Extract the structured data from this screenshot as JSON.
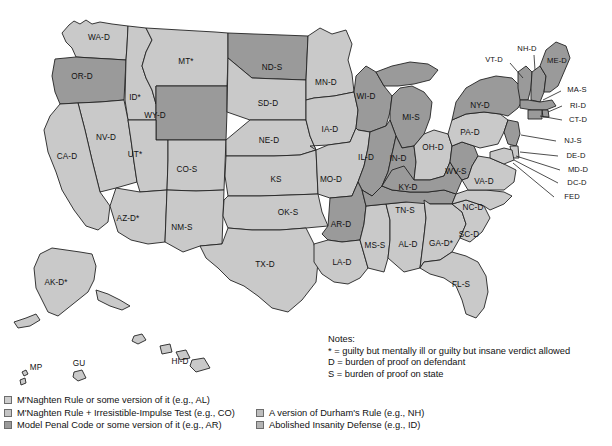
{
  "map": {
    "title_present": false,
    "colors": {
      "shade_light": "#c9c9c9",
      "shade_dark": "#9a9a9a",
      "border": "#222222",
      "background": "#ffffff",
      "label": "#111111"
    },
    "states": [
      {
        "code": "WA-D",
        "x": 99,
        "y": 38,
        "shade": "light"
      },
      {
        "code": "OR-D",
        "x": 82,
        "y": 77,
        "shade": "dark"
      },
      {
        "code": "ID*",
        "x": 135,
        "y": 98,
        "shade": "light"
      },
      {
        "code": "MT*",
        "x": 186,
        "y": 62,
        "shade": "light"
      },
      {
        "code": "ND-S",
        "x": 272,
        "y": 68,
        "shade": "dark"
      },
      {
        "code": "SD-D",
        "x": 268,
        "y": 104,
        "shade": "light"
      },
      {
        "code": "MN-D",
        "x": 326,
        "y": 83,
        "shade": "light"
      },
      {
        "code": "WI-D",
        "x": 366,
        "y": 97,
        "shade": "dark"
      },
      {
        "code": "MI-S",
        "x": 411,
        "y": 118,
        "shade": "dark"
      },
      {
        "code": "WY-D",
        "x": 155,
        "y": 116,
        "shade": "dark"
      },
      {
        "code": "NV-D",
        "x": 106,
        "y": 138,
        "shade": "light"
      },
      {
        "code": "CA-D",
        "x": 67,
        "y": 157,
        "shade": "light"
      },
      {
        "code": "UT*",
        "x": 135,
        "y": 155,
        "shade": "light"
      },
      {
        "code": "CO-S",
        "x": 187,
        "y": 170,
        "shade": "light"
      },
      {
        "code": "NE-D",
        "x": 269,
        "y": 141,
        "shade": "light"
      },
      {
        "code": "IA-D",
        "x": 330,
        "y": 130,
        "shade": "light"
      },
      {
        "code": "IL-D",
        "x": 366,
        "y": 158,
        "shade": "dark"
      },
      {
        "code": "IN-D",
        "x": 398,
        "y": 159,
        "shade": "dark"
      },
      {
        "code": "OH-D",
        "x": 433,
        "y": 148,
        "shade": "light"
      },
      {
        "code": "PA-D",
        "x": 470,
        "y": 133,
        "shade": "light"
      },
      {
        "code": "NY-D",
        "x": 480,
        "y": 106,
        "shade": "dark"
      },
      {
        "code": "KS",
        "x": 276,
        "y": 180,
        "shade": "light"
      },
      {
        "code": "MO-D",
        "x": 331,
        "y": 180,
        "shade": "light"
      },
      {
        "code": "KY-D",
        "x": 408,
        "y": 188,
        "shade": "dark"
      },
      {
        "code": "WV-S",
        "x": 456,
        "y": 172,
        "shade": "dark"
      },
      {
        "code": "VA-D",
        "x": 484,
        "y": 182,
        "shade": "light"
      },
      {
        "code": "AZ-D*",
        "x": 128,
        "y": 219,
        "shade": "light"
      },
      {
        "code": "NM-S",
        "x": 182,
        "y": 228,
        "shade": "light"
      },
      {
        "code": "OK-S",
        "x": 288,
        "y": 213,
        "shade": "light"
      },
      {
        "code": "AR-D",
        "x": 341,
        "y": 225,
        "shade": "dark"
      },
      {
        "code": "TN-S",
        "x": 405,
        "y": 211,
        "shade": "dark"
      },
      {
        "code": "NC-D",
        "x": 473,
        "y": 208,
        "shade": "light"
      },
      {
        "code": "SC-D",
        "x": 469,
        "y": 235,
        "shade": "light"
      },
      {
        "code": "MS-S",
        "x": 375,
        "y": 246,
        "shade": "light"
      },
      {
        "code": "AL-D",
        "x": 408,
        "y": 245,
        "shade": "light"
      },
      {
        "code": "GA-D*",
        "x": 441,
        "y": 244,
        "shade": "light"
      },
      {
        "code": "LA-D",
        "x": 342,
        "y": 263,
        "shade": "light"
      },
      {
        "code": "TX-D",
        "x": 265,
        "y": 265,
        "shade": "light"
      },
      {
        "code": "FL-S",
        "x": 461,
        "y": 285,
        "shade": "light"
      },
      {
        "code": "AK-D*",
        "x": 56,
        "y": 283,
        "shade": "light"
      },
      {
        "code": "HI-D",
        "x": 180,
        "y": 362,
        "shade": "light"
      },
      {
        "code": "MP",
        "x": 36,
        "y": 368,
        "shade": "light"
      },
      {
        "code": "GU",
        "x": 79,
        "y": 364,
        "shade": "light"
      }
    ],
    "callouts": [
      {
        "code": "VT-D",
        "x": 494,
        "y": 60,
        "lx1": 510,
        "ly1": 63,
        "lx2": 523,
        "ly2": 76
      },
      {
        "code": "NH-D",
        "x": 527,
        "y": 49,
        "lx1": 534,
        "ly1": 54,
        "lx2": 534,
        "ly2": 70
      },
      {
        "code": "ME-D",
        "x": 557,
        "y": 61,
        "lx1": 551,
        "ly1": 61,
        "lx2": 551,
        "ly2": 61
      },
      {
        "code": "MA-S",
        "x": 577,
        "y": 90,
        "lx1": 561,
        "ly1": 91,
        "lx2": 542,
        "ly2": 95
      },
      {
        "code": "RI-D",
        "x": 578,
        "y": 106,
        "lx1": 562,
        "ly1": 107,
        "lx2": 545,
        "ly2": 103
      },
      {
        "code": "CT-D",
        "x": 578,
        "y": 120,
        "lx1": 562,
        "ly1": 120,
        "lx2": 540,
        "ly2": 108
      },
      {
        "code": "NJ-S",
        "x": 573,
        "y": 141,
        "lx1": 557,
        "ly1": 141,
        "lx2": 524,
        "ly2": 137
      },
      {
        "code": "DE-D",
        "x": 576,
        "y": 156,
        "lx1": 560,
        "ly1": 156,
        "lx2": 521,
        "ly2": 152
      },
      {
        "code": "MD-D",
        "x": 578,
        "y": 170,
        "lx1": 561,
        "ly1": 170,
        "lx2": 517,
        "ly2": 157
      },
      {
        "code": "DC-D",
        "x": 577,
        "y": 183,
        "lx1": 560,
        "ly1": 183,
        "lx2": 515,
        "ly2": 160
      },
      {
        "code": "FED",
        "x": 572,
        "y": 197,
        "lx1": 556,
        "ly1": 197,
        "lx2": 514,
        "ly2": 163
      }
    ]
  },
  "notes": {
    "title": "Notes:",
    "lines": [
      "*  = guilty but mentally ill or guilty but insane verdict allowed",
      "D = burden of proof on defendant",
      "S = burden of proof on state"
    ]
  },
  "legend": {
    "left_items": [
      "M'Naghten Rule or some version of it (e.g., AL)",
      "M'Naghten Rule + Irresistible-Impulse Test (e.g., CO)",
      "Model Penal Code or some version of it (e.g., AR)"
    ],
    "right_items": [
      "A version of Durham's Rule (e.g., NH)",
      "Abolished Insanity Defense (e.g., ID)"
    ]
  }
}
